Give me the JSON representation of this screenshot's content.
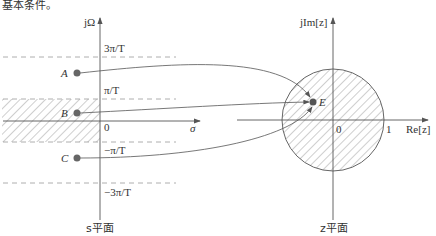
{
  "header_text": "基本条件。",
  "s_plane": {
    "title": "s平面",
    "y_axis_label": "jΩ",
    "x_axis_label": "σ",
    "origin_label": "0",
    "levels": [
      "3π/T",
      "π/T",
      "−π/T",
      "−3π/T"
    ],
    "points": [
      {
        "name": "A",
        "x": 77,
        "y": 73
      },
      {
        "name": "B",
        "x": 77,
        "y": 113
      },
      {
        "name": "C",
        "x": 77,
        "y": 158
      }
    ],
    "hatched_region": "left half-plane strip between −π/T and π/T"
  },
  "z_plane": {
    "title": "z平面",
    "y_axis_label": "jIm[z]",
    "x_axis_label": "Re[z]",
    "origin_label": "0",
    "unit_label": "1",
    "mapped_point": "E",
    "hatched_region": "unit circle interior"
  },
  "colors": {
    "line": "#555555",
    "point": "#666666",
    "hatch": "#888888"
  }
}
